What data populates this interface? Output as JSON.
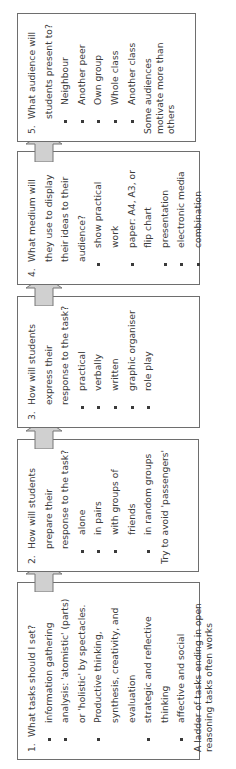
{
  "diagram": {
    "colors": {
      "border": "#6e6e6e",
      "arrow_fill": "#d0d0d0",
      "arrow_stroke": "#777777",
      "text": "#3a3a3a"
    },
    "boxes": [
      {
        "number": "1.",
        "question": "What tasks should I set?",
        "items": [
          "information gathering",
          "analysis: 'atomistic' (parts) or 'holistic' by spectacles.",
          "Productive thinking, synthesis, creativity, and evaluation",
          "strategic and reflective thinking",
          "affective and social"
        ],
        "note": "A ladder of tasks ending in open reasoning tasks often works"
      },
      {
        "number": "2.",
        "question": "How will students prepare their response to the task?",
        "items": [
          "alone",
          "in pairs",
          "with groups of friends",
          "in random groups"
        ],
        "note": "Try to avoid 'passengers'"
      },
      {
        "number": "3.",
        "question": "How will students express their response to the task?",
        "items": [
          "practical",
          "verbally",
          "written",
          "graphic organiser",
          "role play"
        ],
        "note": ""
      },
      {
        "number": "4.",
        "question": "What medium will they use to display their ideas to their audience?",
        "items": [
          "show practical work",
          "paper: A4, A3, or flip chart",
          "presentation",
          "electronic media",
          "combination"
        ],
        "note": ""
      },
      {
        "number": "5.",
        "question": "What audience will students present to?",
        "items": [
          "Neighbour",
          "Another peer",
          "Own group",
          "Whole class",
          "Another class"
        ],
        "note": "Some audiences motivate more than others"
      }
    ],
    "arrows": [
      {
        "from": "1",
        "to": "2",
        "direction": "up"
      },
      {
        "from": "2",
        "to": "3",
        "direction": "up"
      },
      {
        "from": "3",
        "to": "4",
        "direction": "up"
      },
      {
        "from": "4",
        "to": "5",
        "direction": "up"
      }
    ]
  }
}
